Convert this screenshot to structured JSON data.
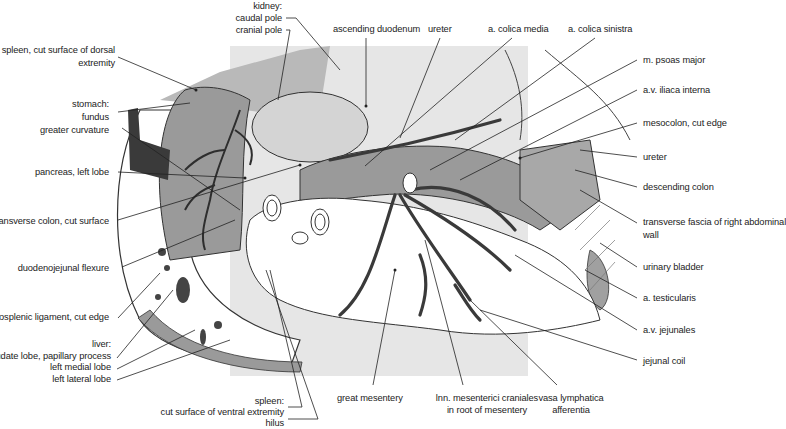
{
  "figure": {
    "type": "anatomical illustration",
    "colors": {
      "background": "#ffffff",
      "backdrop_panel": "#e6e6e6",
      "organ_mid_gray": "#9a9a9a",
      "organ_light_gray": "#d4d4d4",
      "vessel_dark": "#3a3a3a",
      "line": "#222222"
    }
  },
  "labels": {
    "left": {
      "spleen_dorsal": [
        "spleen, cut surface of dorsal",
        "extremity"
      ],
      "stomach": [
        "stomach:",
        "fundus",
        "greater curvature"
      ],
      "pancreas": "pancreas, left lobe",
      "transverse_colon": "transverse colon, cut surface",
      "duodenojejunal": "duodenojejunal flexure",
      "gastrosplenic": "gastrosplenic ligament, cut edge",
      "liver": [
        "liver:",
        "caudate lobe, papillary process",
        "left medial lobe",
        "left lateral lobe"
      ]
    },
    "top": {
      "kidney": [
        "kidney:",
        "caudal pole",
        "cranial pole"
      ],
      "ascending_duodenum": "ascending duodenum",
      "ureter": "ureter",
      "colica_media": "a. colica media",
      "colica_sinistra": "a. colica sinistra"
    },
    "right": {
      "psoas": "m. psoas major",
      "iliaca": "a.v. iliaca interna",
      "mesocolon": "mesocolon, cut edge",
      "ureter": "ureter",
      "descending_colon": "descending colon",
      "transverse_fascia": [
        "transverse fascia of right abdominal",
        "wall"
      ],
      "urinary_bladder": "urinary bladder",
      "testicularis": "a. testicularis",
      "jejunales": "a.v. jejunales",
      "jejunal_coil": "jejunal coil"
    },
    "bottom": {
      "spleen_ventral": [
        "spleen:",
        "cut surface of ventral extremity",
        "hilus"
      ],
      "great_mesentery": "great mesentery",
      "lnn": [
        "lnn. mesenterici craniales",
        "in root of mesentery"
      ],
      "vasa": [
        "vasa lymphatica",
        "afferentia"
      ]
    }
  }
}
